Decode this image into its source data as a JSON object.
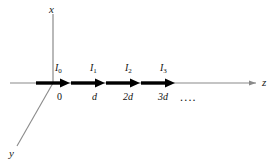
{
  "figure": {
    "type": "physics-diagram",
    "background_color": "#ffffff",
    "axes": [
      {
        "name": "x",
        "label": "x",
        "orientation": "vertical-up",
        "color": "#8a8a8a"
      },
      {
        "name": "y",
        "label": "y",
        "orientation": "diagonal-down-left",
        "color": "#8a8a8a"
      },
      {
        "name": "z",
        "label": "z",
        "orientation": "horizontal-right",
        "color": "#8a8a8a"
      }
    ],
    "origin_label": "0",
    "elements": [
      {
        "label": "I",
        "subscript": "0",
        "position_label": "0"
      },
      {
        "label": "I",
        "subscript": "1",
        "position_label": "d"
      },
      {
        "label": "I",
        "subscript": "2",
        "position_label": "2d"
      },
      {
        "label": "I",
        "subscript": "3",
        "position_label": "3d"
      }
    ],
    "continuation": "....",
    "arrow_color": "#000000",
    "spacing_label": "d"
  }
}
